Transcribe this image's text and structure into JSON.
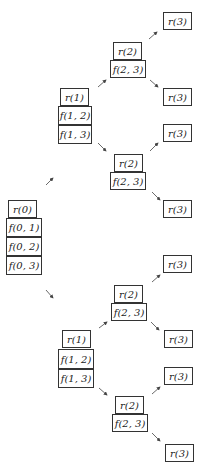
{
  "diagram": {
    "type": "recursion-tree",
    "root": {
      "label": "r(0)",
      "stack": [
        "f(0,1)",
        "f(0,2)",
        "f(0,3)"
      ]
    },
    "nodes": [
      {
        "id": "n_r3_a",
        "label": "r(3)",
        "x": 163,
        "y": 12,
        "w": 29,
        "h": 18
      },
      {
        "id": "n_r2_a",
        "label": "r(2)",
        "x": 113,
        "y": 42,
        "w": 29,
        "h": 18
      },
      {
        "id": "n_f23_a",
        "label": "f(2, 3)",
        "x": 110,
        "y": 60,
        "w": 36,
        "h": 18
      },
      {
        "id": "n_r3_b",
        "label": "r(3)",
        "x": 163,
        "y": 88,
        "w": 29,
        "h": 18
      },
      {
        "id": "n_r1_a",
        "label": "r(1)",
        "x": 60,
        "y": 88,
        "w": 29,
        "h": 18
      },
      {
        "id": "n_f12_a",
        "label": "f(1, 2)",
        "x": 58,
        "y": 106,
        "w": 34,
        "h": 19
      },
      {
        "id": "n_f13_a",
        "label": "f(1, 3)",
        "x": 58,
        "y": 125,
        "w": 34,
        "h": 19
      },
      {
        "id": "n_r3_c",
        "label": "r(3)",
        "x": 163,
        "y": 124,
        "w": 29,
        "h": 18
      },
      {
        "id": "n_r2_b",
        "label": "r(2)",
        "x": 114,
        "y": 154,
        "w": 29,
        "h": 18
      },
      {
        "id": "n_f23_b",
        "label": "f(2, 3)",
        "x": 110,
        "y": 172,
        "w": 36,
        "h": 18
      },
      {
        "id": "n_r3_d",
        "label": "r(3)",
        "x": 163,
        "y": 200,
        "w": 29,
        "h": 18
      },
      {
        "id": "n_r0",
        "label": "r(0)",
        "x": 8,
        "y": 200,
        "w": 29,
        "h": 18
      },
      {
        "id": "n_f01",
        "label": "f(0, 1)",
        "x": 6,
        "y": 218,
        "w": 36,
        "h": 19
      },
      {
        "id": "n_f02",
        "label": "f(0, 2)",
        "x": 6,
        "y": 237,
        "w": 36,
        "h": 19
      },
      {
        "id": "n_f03",
        "label": "f(0, 3)",
        "x": 6,
        "y": 256,
        "w": 36,
        "h": 19
      },
      {
        "id": "n_r3_e",
        "label": "r(3)",
        "x": 163,
        "y": 255,
        "w": 29,
        "h": 18
      },
      {
        "id": "n_r2_c",
        "label": "r(2)",
        "x": 114,
        "y": 285,
        "w": 29,
        "h": 18
      },
      {
        "id": "n_f23_c",
        "label": "f(2, 3)",
        "x": 111,
        "y": 303,
        "w": 36,
        "h": 18
      },
      {
        "id": "n_r3_f",
        "label": "r(3)",
        "x": 164,
        "y": 330,
        "w": 29,
        "h": 18
      },
      {
        "id": "n_r1_b",
        "label": "r(1)",
        "x": 62,
        "y": 330,
        "w": 29,
        "h": 18
      },
      {
        "id": "n_f12_b",
        "label": "f(1, 2)",
        "x": 58,
        "y": 349,
        "w": 36,
        "h": 20
      },
      {
        "id": "n_f13_b",
        "label": "f(1, 3)",
        "x": 58,
        "y": 369,
        "w": 36,
        "h": 19
      },
      {
        "id": "n_r3_g",
        "label": "r(3)",
        "x": 164,
        "y": 367,
        "w": 29,
        "h": 18
      },
      {
        "id": "n_r2_d",
        "label": "r(2)",
        "x": 115,
        "y": 396,
        "w": 29,
        "h": 18
      },
      {
        "id": "n_f23_d",
        "label": "f(2, 3)",
        "x": 112,
        "y": 414,
        "w": 36,
        "h": 18
      },
      {
        "id": "n_r3_h",
        "label": "r(3)",
        "x": 165,
        "y": 444,
        "w": 29,
        "h": 18
      }
    ],
    "arrows": [
      {
        "x1": 149,
        "y1": 39,
        "x2": 157,
        "y2": 32
      },
      {
        "x1": 150,
        "y1": 80,
        "x2": 158,
        "y2": 87
      },
      {
        "x1": 98,
        "y1": 87,
        "x2": 106,
        "y2": 80
      },
      {
        "x1": 98,
        "y1": 143,
        "x2": 106,
        "y2": 151
      },
      {
        "x1": 150,
        "y1": 151,
        "x2": 158,
        "y2": 143
      },
      {
        "x1": 152,
        "y1": 192,
        "x2": 160,
        "y2": 200
      },
      {
        "x1": 46,
        "y1": 185,
        "x2": 53,
        "y2": 178
      },
      {
        "x1": 46,
        "y1": 290,
        "x2": 53,
        "y2": 298
      },
      {
        "x1": 152,
        "y1": 282,
        "x2": 160,
        "y2": 275
      },
      {
        "x1": 151,
        "y1": 322,
        "x2": 159,
        "y2": 330
      },
      {
        "x1": 99,
        "y1": 328,
        "x2": 107,
        "y2": 322
      },
      {
        "x1": 99,
        "y1": 388,
        "x2": 107,
        "y2": 395
      },
      {
        "x1": 152,
        "y1": 394,
        "x2": 160,
        "y2": 387
      },
      {
        "x1": 152,
        "y1": 433,
        "x2": 160,
        "y2": 441
      }
    ]
  }
}
